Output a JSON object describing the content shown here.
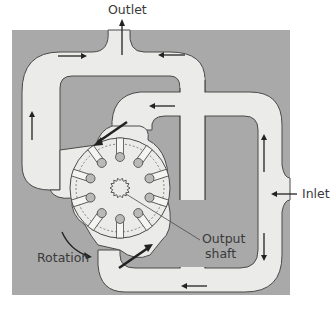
{
  "diagram": {
    "labels": {
      "outlet": "Outlet",
      "inlet": "Inlet",
      "rotation": "Rotation",
      "output_shaft_line1": "Output",
      "output_shaft_line2": "shaft"
    },
    "vane_count": 10,
    "colors": {
      "housing_background": "#a9a9a9",
      "fluid_channel": "#ebebe9",
      "outline": "#4a4a4a",
      "vane_fill": "#f4f4f2",
      "vane_tip": "#b9b9b9",
      "arrow": "#222222",
      "label_text": "#3a3a3a"
    },
    "flow_arrows": [
      {
        "location": "top-left channel",
        "direction": "right"
      },
      {
        "location": "top-right channel",
        "direction": "left"
      },
      {
        "location": "outlet",
        "direction": "up"
      },
      {
        "location": "left channel",
        "direction": "up"
      },
      {
        "location": "upper inner channel",
        "direction": "left"
      },
      {
        "location": "right channel upper",
        "direction": "up"
      },
      {
        "location": "inlet",
        "direction": "left"
      },
      {
        "location": "right channel lower",
        "direction": "down"
      },
      {
        "location": "bottom channel",
        "direction": "left"
      }
    ]
  }
}
